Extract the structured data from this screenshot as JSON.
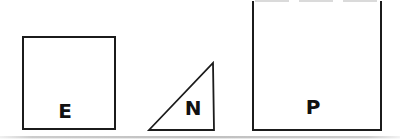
{
  "figure": {
    "background_color": "#ffffff",
    "stroke_color": "#1b1b1b",
    "label_color": "#111111",
    "faint_edge_color": "#b5b5b5",
    "artifact_color": "#c3c3c3",
    "shapes": [
      {
        "id": "square-e",
        "type": "square",
        "label": "E"
      },
      {
        "id": "triangle-n",
        "type": "right-triangle",
        "label": "N"
      },
      {
        "id": "square-p",
        "type": "square",
        "label": "P"
      }
    ]
  }
}
